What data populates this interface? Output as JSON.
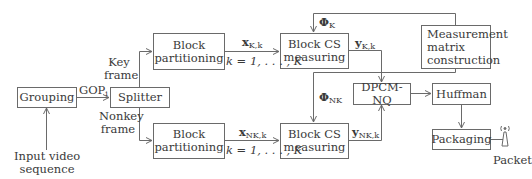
{
  "diagram": {
    "nodes": {
      "grouping": "Grouping",
      "splitter": "Splitter",
      "block_partitioning_key": [
        "Block",
        "partitioning"
      ],
      "block_partitioning_nonkey": [
        "Block",
        "partitioning"
      ],
      "block_cs_key": [
        "Block CS",
        "measuring"
      ],
      "block_cs_nonkey": [
        "Block CS",
        "measuring"
      ],
      "measurement_matrix": [
        "Measurement",
        "matrix",
        "construction"
      ],
      "dpcm_nq": "DPCM-NQ",
      "huffman": "Huffman",
      "packaging": "Packaging"
    },
    "labels": {
      "input": [
        "Input video",
        "sequence"
      ],
      "gop": "GOP",
      "gop_sub": "i",
      "key_frame": [
        "Key",
        "frame"
      ],
      "nonkey_frame": [
        "Nonkey",
        "frame"
      ],
      "x_key": "x",
      "x_key_sub": "K,k",
      "x_nonkey": "x",
      "x_nonkey_sub": "NK,k",
      "range_key": "k = 1, . . . , K",
      "range_nonkey": "k = 1, . . . , K",
      "phi_key": "Φ",
      "phi_key_sub": "K",
      "phi_nonkey": "Φ",
      "phi_nonkey_sub": "NK",
      "y_key": "y",
      "y_key_sub": "K,k",
      "y_nonkey": "y",
      "y_nonkey_sub": "NK,k",
      "packet": "Packet"
    },
    "edges": [
      [
        "input",
        "grouping"
      ],
      [
        "grouping",
        "splitter"
      ],
      [
        "splitter",
        "block_partitioning_key"
      ],
      [
        "splitter",
        "block_partitioning_nonkey"
      ],
      [
        "block_partitioning_key",
        "block_cs_key"
      ],
      [
        "block_partitioning_nonkey",
        "block_cs_nonkey"
      ],
      [
        "measurement_matrix",
        "block_cs_key"
      ],
      [
        "measurement_matrix",
        "block_cs_nonkey"
      ],
      [
        "block_cs_key",
        "dpcm_nq"
      ],
      [
        "block_cs_nonkey",
        "dpcm_nq"
      ],
      [
        "dpcm_nq",
        "huffman"
      ],
      [
        "huffman",
        "packaging"
      ],
      [
        "packaging",
        "packet"
      ]
    ],
    "colors": {
      "line": "#6a6a6a",
      "text": "#3a3a3a",
      "background": "#ffffff"
    }
  }
}
